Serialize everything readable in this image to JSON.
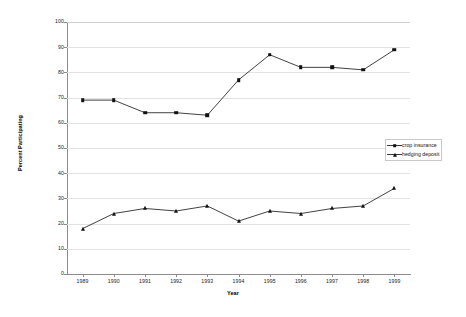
{
  "chart_data": {
    "type": "line",
    "title": "",
    "xlabel": "Year",
    "ylabel": "Percent Participating",
    "categories": [
      "1989",
      "1990",
      "1991",
      "1992",
      "1993",
      "1994",
      "1995",
      "1996",
      "1997",
      "1998",
      "1999"
    ],
    "x": [
      1989,
      1990,
      1991,
      1992,
      1993,
      1994,
      1995,
      1996,
      1997,
      1998,
      1999
    ],
    "xlim": [
      1988.5,
      1999.5
    ],
    "ylim": [
      0,
      100
    ],
    "yticks": [
      0,
      10,
      20,
      30,
      40,
      50,
      60,
      70,
      80,
      90,
      100
    ],
    "grid": true,
    "legend_position": "right",
    "series": [
      {
        "name": "crop insurance",
        "marker": "square",
        "color": "#111111",
        "values": [
          69,
          69,
          64,
          64,
          63,
          77,
          87,
          82,
          82,
          81,
          89
        ]
      },
      {
        "name": "hedging deposit",
        "marker": "triangle",
        "color": "#111111",
        "values": [
          18,
          24,
          26,
          25,
          27,
          21,
          25,
          24,
          26,
          27,
          34
        ]
      }
    ]
  },
  "axes": {
    "y_title": "Percent Participating",
    "x_title": "Year",
    "y_tick_labels": [
      "100",
      "90",
      "80",
      "70",
      "60",
      "50",
      "40",
      "30",
      "20",
      "10",
      "0"
    ],
    "x_tick_labels": [
      "1989",
      "1990",
      "1991",
      "1992",
      "1993",
      "1994",
      "1995",
      "1996",
      "1997",
      "1998",
      "1999"
    ]
  },
  "legend": {
    "items": [
      {
        "label": "crop insurance",
        "marker": "square-marker"
      },
      {
        "label": "hedging deposit",
        "marker": "triangle-marker"
      }
    ]
  },
  "colors": {
    "gridline": "#e3e3e3",
    "axis": "#8c8c8c",
    "series": "#111111",
    "background": "#ffffff"
  }
}
